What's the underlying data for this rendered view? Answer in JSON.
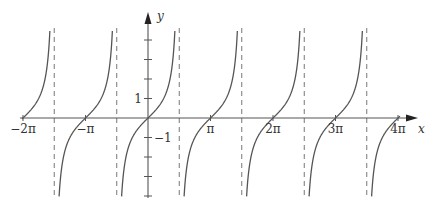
{
  "chart_data": {
    "type": "line",
    "title": "",
    "function": "y = tan(x)",
    "xlabel": "x",
    "ylabel": "y",
    "x_ticks": [
      {
        "value": -6.2832,
        "label": "−2π"
      },
      {
        "value": -3.1416,
        "label": "−π"
      },
      {
        "value": 3.1416,
        "label": "π"
      },
      {
        "value": 6.2832,
        "label": "2π"
      },
      {
        "value": 9.4248,
        "label": "3π"
      },
      {
        "value": 12.5664,
        "label": "4π"
      }
    ],
    "y_ticks": [
      {
        "value": 1,
        "label": "1"
      },
      {
        "value": -1,
        "label": "−1"
      }
    ],
    "y_tick_marks": [
      -4,
      -3,
      -2,
      -1,
      1,
      2,
      3,
      4
    ],
    "asymptotes": [
      "−3π/2",
      "−π/2",
      "π/2",
      "3π/2",
      "5π/2",
      "7π/2"
    ],
    "asymptote_values": [
      -4.7124,
      -1.5708,
      1.5708,
      4.7124,
      7.854,
      10.9956
    ],
    "xlim": [
      -6.6,
      13.3
    ],
    "ylim": [
      -4.5,
      4.7
    ],
    "grid": false,
    "legend": null,
    "asymptote_style": "dashed",
    "zeros": [
      -6.2832,
      -3.1416,
      0,
      3.1416,
      6.2832,
      9.4248,
      12.5664
    ]
  },
  "colors": {
    "curve": "#555555",
    "axis": "#555555",
    "asymptote": "#777777",
    "text": "#333333"
  }
}
